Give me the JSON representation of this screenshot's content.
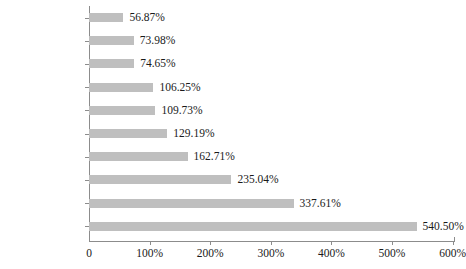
{
  "chart_data": {
    "type": "bar",
    "orientation": "horizontal",
    "title": "",
    "subtitle": "",
    "xlabel": "",
    "ylabel": "",
    "grid": false,
    "legend": false,
    "legend_position": "none",
    "bar_color": "#bfbfbf",
    "axis_color": "#8c8c8c",
    "xlim": [
      0,
      600
    ],
    "xticks": [
      0,
      100,
      200,
      300,
      400,
      500,
      600
    ],
    "xtick_labels": [
      "0",
      "100%",
      "200%",
      "300%",
      "400%",
      "500%",
      "600%"
    ],
    "categories": [
      "青蒿",
      "川芎",
      "党参",
      "枸杞",
      "黄芪",
      "半夏",
      "槐米",
      "三七（田七）",
      "已磨的姜",
      "甜叶菊叶"
    ],
    "values": [
      56.87,
      73.98,
      74.65,
      106.25,
      109.73,
      129.19,
      162.71,
      235.04,
      337.61,
      540.5
    ],
    "value_labels": [
      "56.87%",
      "73.98%",
      "74.65%",
      "106.25%",
      "109.73%",
      "129.19%",
      "162.71%",
      "235.04%",
      "337.61%",
      "540.50%"
    ]
  }
}
